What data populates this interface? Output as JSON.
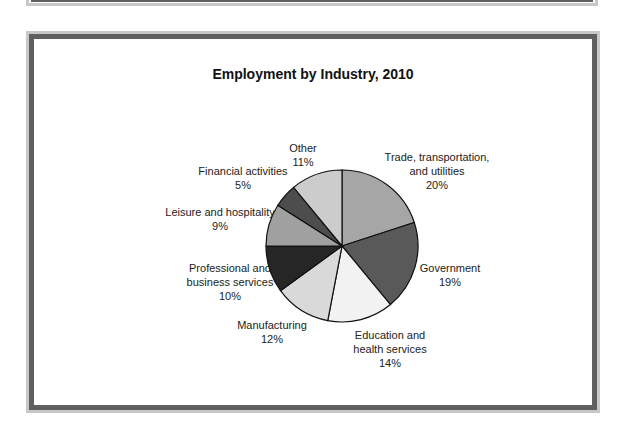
{
  "chart_data": {
    "type": "pie",
    "title": "Employment by Industry, 2010",
    "categories": [
      "Trade, transportation, and utilities",
      "Government",
      "Education and health services",
      "Manufacturing",
      "Professional and business services",
      "Leisure and hospitality",
      "Financial activities",
      "Other"
    ],
    "values": [
      20,
      19,
      14,
      12,
      10,
      9,
      5,
      11
    ],
    "unit": "%",
    "start_angle": "12 o'clock",
    "direction": "clockwise",
    "colors": [
      "#a6a6a6",
      "#595959",
      "#f2f2f2",
      "#d9d9d9",
      "#262626",
      "#a0a0a0",
      "#4d4d4d",
      "#cccccc"
    ],
    "legend": "none (data labels outside slices)"
  },
  "labels": {
    "trade": {
      "line1": "Trade, transportation,",
      "line2": "and utilities",
      "pct": "20%"
    },
    "government": {
      "line1": "Government",
      "pct": "19%"
    },
    "education": {
      "line1": "Education and",
      "line2": "health services",
      "pct": "14%"
    },
    "manufacturing": {
      "line1": "Manufacturing",
      "pct": "12%"
    },
    "professional": {
      "line1": "Professional and",
      "line2": "business services",
      "pct": "10%"
    },
    "leisure": {
      "line1": "Leisure and hospitality",
      "pct": "9%"
    },
    "financial": {
      "line1": "Financial activities",
      "pct": "5%"
    },
    "other": {
      "line1": "Other",
      "pct": "11%"
    }
  }
}
